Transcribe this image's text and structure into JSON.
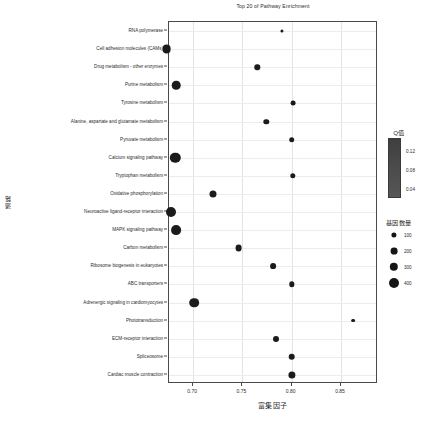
{
  "chart_data": {
    "type": "scatter",
    "title": "Top 20 of Pathway Enrichment",
    "xlabel": "富集因子",
    "ylabel": "通路",
    "xlim": [
      0.6755,
      0.8875
    ],
    "xticks": [
      0.7,
      0.75,
      0.8,
      0.85
    ],
    "xtick_labels": [
      "0.70",
      "0.75",
      "0.80",
      "0.85"
    ],
    "grid": true,
    "legend_position": "right",
    "categories": [
      "RNA polymerase",
      "Cell adhesion molecules (CAMs)",
      "Drug metabolism - other enzymes",
      "Purine metabolism",
      "Tyrosine metabolism",
      "Alanine, aspartate and glutamate metabolism",
      "Pyruvate metabolism",
      "Calcium signaling pathway",
      "Tryptophan metabolism",
      "Oxidative phosphorylation",
      "Neuroactive ligand-receptor interaction",
      "MAPK signaling pathway",
      "Carbon metabolism",
      "Ribosome biogenesis in eukaryotes",
      "ABC transporters",
      "Adrenergic signaling in cardiomyocytes",
      "Phototransduction",
      "ECM-receptor interaction",
      "Spliceosome",
      "Cardiac muscle contraction"
    ],
    "points": [
      {
        "pathway": "RNA polymerase",
        "x": 0.79,
        "gene_count": 40,
        "radius": 1.6
      },
      {
        "pathway": "Cell adhesion molecules (CAMs)",
        "x": 0.673,
        "gene_count": 310,
        "radius": 4.4
      },
      {
        "pathway": "Drug metabolism - other enzymes",
        "x": 0.765,
        "gene_count": 120,
        "radius": 2.7
      },
      {
        "pathway": "Purine metabolism",
        "x": 0.683,
        "gene_count": 300,
        "radius": 4.3
      },
      {
        "pathway": "Tyrosine metabolism",
        "x": 0.801,
        "gene_count": 105,
        "radius": 2.4
      },
      {
        "pathway": "Alanine, aspartate and glutamate metabolism",
        "x": 0.774,
        "gene_count": 120,
        "radius": 2.7
      },
      {
        "pathway": "Pyruvate metabolism",
        "x": 0.8,
        "gene_count": 130,
        "radius": 2.8
      },
      {
        "pathway": "Calcium signaling pathway",
        "x": 0.682,
        "gene_count": 420,
        "radius": 5.2
      },
      {
        "pathway": "Tryptophan metabolism",
        "x": 0.801,
        "gene_count": 125,
        "radius": 2.7
      },
      {
        "pathway": "Oxidative phosphorylation",
        "x": 0.72,
        "gene_count": 200,
        "radius": 3.5
      },
      {
        "pathway": "Neuroactive ligand-receptor interaction",
        "x": 0.678,
        "gene_count": 400,
        "radius": 5.0
      },
      {
        "pathway": "MAPK signaling pathway",
        "x": 0.683,
        "gene_count": 390,
        "radius": 4.9
      },
      {
        "pathway": "Carbon metabolism",
        "x": 0.746,
        "gene_count": 190,
        "radius": 3.4
      },
      {
        "pathway": "Ribosome biogenesis in eukaryotes",
        "x": 0.781,
        "gene_count": 140,
        "radius": 2.9
      },
      {
        "pathway": "ABC transporters",
        "x": 0.8,
        "gene_count": 120,
        "radius": 2.7
      },
      {
        "pathway": "Adrenergic signaling in cardiomyocytes",
        "x": 0.701,
        "gene_count": 370,
        "radius": 4.8
      },
      {
        "pathway": "Phototransduction",
        "x": 0.862,
        "gene_count": 60,
        "radius": 1.9
      },
      {
        "pathway": "ECM-receptor interaction",
        "x": 0.784,
        "gene_count": 150,
        "radius": 3.0
      },
      {
        "pathway": "Spliceosome",
        "x": 0.8,
        "gene_count": 180,
        "radius": 3.3
      },
      {
        "pathway": "Cardiac muscle contraction",
        "x": 0.8,
        "gene_count": 200,
        "radius": 3.6
      }
    ],
    "point_color": "#1b1b1b"
  },
  "legends": {
    "qvalue": {
      "title": "Q值",
      "ticks": [
        "0.12",
        "0.08",
        "0.04"
      ],
      "gradient_top": "#3f3f3f",
      "gradient_bottom": "#565656"
    },
    "gene_count": {
      "title": "基因数量",
      "items": [
        {
          "label": "100",
          "radius": 2.6
        },
        {
          "label": "200",
          "radius": 3.4
        },
        {
          "label": "300",
          "radius": 4.2
        },
        {
          "label": "400",
          "radius": 5.0
        }
      ],
      "color": "#151515"
    }
  }
}
